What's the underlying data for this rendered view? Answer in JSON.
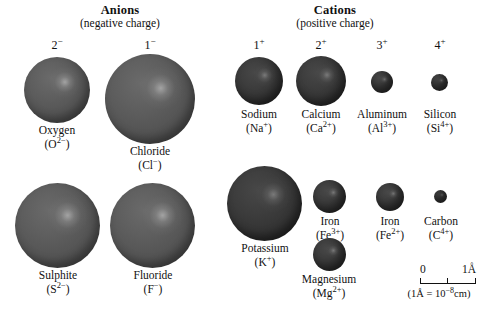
{
  "figure": {
    "sections": [
      {
        "id": "anions",
        "title": "Anions",
        "subtitle": "(negative charge)"
      },
      {
        "id": "cations",
        "title": "Cations",
        "subtitle": "(positive charge)"
      }
    ],
    "charge_labels": {
      "anion_2minus": "2",
      "anion_1minus": "1",
      "cation_1plus": "1",
      "cation_2plus": "2",
      "cation_3plus": "3",
      "cation_4plus": "4",
      "minus_sign": "−",
      "plus_sign": "+"
    },
    "ions": [
      {
        "id": "oxygen",
        "group": "anion",
        "name": "Oxygen",
        "symbol": "O",
        "charge": "2−",
        "formula_plain": "(O2−)",
        "diameter_px": 66
      },
      {
        "id": "chloride",
        "group": "anion",
        "name": "Chloride",
        "symbol": "Cl",
        "charge": "−",
        "formula_plain": "(Cl−)",
        "diameter_px": 90
      },
      {
        "id": "sulphite",
        "group": "anion",
        "name": "Sulphite",
        "symbol": "S",
        "charge": "2−",
        "formula_plain": "(S2−)",
        "diameter_px": 85
      },
      {
        "id": "fluoride",
        "group": "anion",
        "name": "Fluoride",
        "symbol": "F",
        "charge": "−",
        "formula_plain": "(F−)",
        "diameter_px": 85
      },
      {
        "id": "sodium",
        "group": "cation",
        "name": "Sodium",
        "symbol": "Na",
        "charge": "+",
        "formula_plain": "(Na+)",
        "diameter_px": 48
      },
      {
        "id": "calcium",
        "group": "cation",
        "name": "Calcium",
        "symbol": "Ca",
        "charge": "2+",
        "formula_plain": "(Ca2+)",
        "diameter_px": 50
      },
      {
        "id": "aluminum",
        "group": "cation",
        "name": "Aluminum",
        "symbol": "Al",
        "charge": "3+",
        "formula_plain": "(Al3+)",
        "diameter_px": 22
      },
      {
        "id": "silicon",
        "group": "cation",
        "name": "Silicon",
        "symbol": "Si",
        "charge": "4+",
        "formula_plain": "(Si4+)",
        "diameter_px": 17
      },
      {
        "id": "potassium",
        "group": "cation",
        "name": "Potassium",
        "symbol": "K",
        "charge": "+",
        "formula_plain": "(K+)",
        "diameter_px": 75
      },
      {
        "id": "iron3",
        "group": "cation",
        "name": "Iron",
        "symbol": "Fe",
        "charge": "3+",
        "formula_plain": "(Fe3+)",
        "diameter_px": 33
      },
      {
        "id": "magnesium",
        "group": "cation",
        "name": "Magnesium",
        "symbol": "Mg",
        "charge": "2+",
        "formula_plain": "(Mg2+)",
        "diameter_px": 33
      },
      {
        "id": "iron2",
        "group": "cation",
        "name": "Iron",
        "symbol": "Fe",
        "charge": "2+",
        "formula_plain": "(Fe2+)",
        "diameter_px": 28
      },
      {
        "id": "carbon",
        "group": "cation",
        "name": "Carbon",
        "symbol": "C",
        "charge": "4+",
        "formula_plain": "(C4+)",
        "diameter_px": 13
      }
    ],
    "scale": {
      "start_label": "0",
      "end_label": "1Å",
      "note_prefix": "(1Å = 10",
      "note_exponent": "−8",
      "note_suffix": "cm)",
      "ticks": 3
    },
    "colors": {
      "background": "#ffffff",
      "text": "#111111",
      "anion_sphere": "#555555",
      "cation_sphere": "#353535",
      "highlight": "#e8e8e8"
    }
  }
}
